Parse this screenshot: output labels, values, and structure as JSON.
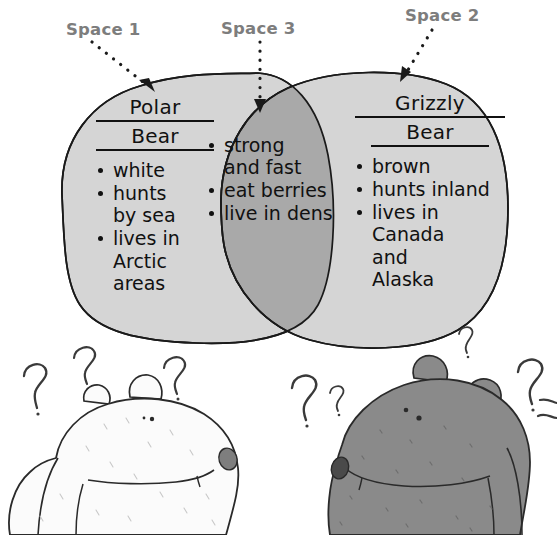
{
  "callouts": [
    {
      "id": "space-1",
      "label": "Space 1"
    },
    {
      "id": "space-3",
      "label": "Space 3"
    },
    {
      "id": "space-2",
      "label": "Space 2"
    }
  ],
  "venn": {
    "left": {
      "heading_line1": "Polar",
      "heading_line2": "Bear",
      "items": [
        {
          "line1": "white"
        },
        {
          "line1": "hunts",
          "line2": "by sea"
        },
        {
          "line1": "lives in",
          "line2": "Arctic",
          "line3": "areas"
        }
      ],
      "fill": "#d5d5d5"
    },
    "middle": {
      "items": [
        {
          "line1": "strong",
          "line2": "and fast"
        },
        {
          "line1": "eat berries"
        },
        {
          "line1": "live in dens"
        }
      ],
      "fill": "#a9a9a9"
    },
    "right": {
      "heading_line1": "Grizzly",
      "heading_line2": "Bear",
      "items": [
        {
          "line1": "brown"
        },
        {
          "line1": "hunts inland"
        },
        {
          "line1": "lives in",
          "line2": "Canada",
          "line3": "and",
          "line4": "Alaska"
        }
      ],
      "fill": "#d5d5d5"
    }
  },
  "illustration": {
    "left_bear": {
      "name": "polar-bear",
      "body_fill": "#fbfbfb"
    },
    "right_bear": {
      "name": "grizzly-bear",
      "body_fill": "#8a8a8a"
    },
    "question_marks_left": 3,
    "question_marks_right": 4
  },
  "colors": {
    "outline": "#1a1a1a",
    "label_gray": "#7d7d7d",
    "region_light": "#d5d5d5",
    "region_dark": "#a9a9a9",
    "page_background": "#ffffff"
  }
}
